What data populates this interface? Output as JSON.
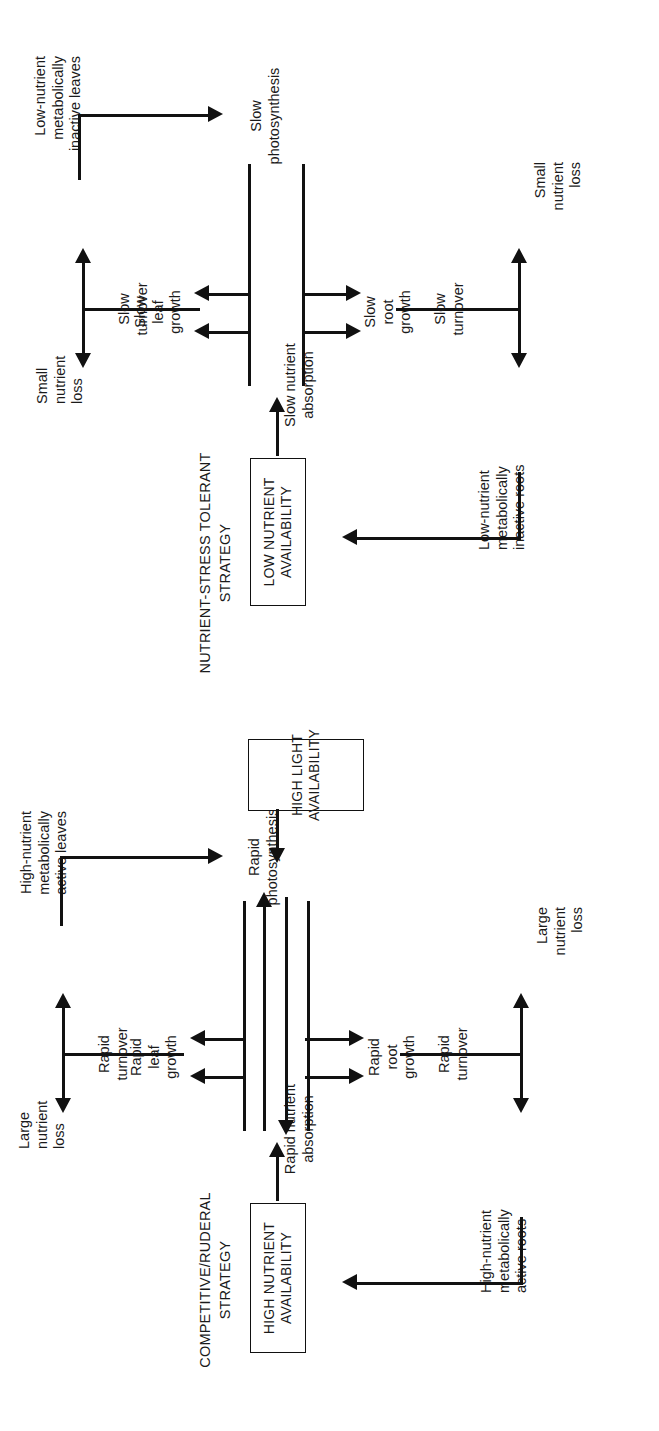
{
  "figure": {
    "ink_color": "#111111",
    "background_color": "#ffffff"
  },
  "panels": [
    {
      "id": "competitive-ruderal",
      "title": "COMPETITIVE/RUDERAL\nSTRATEGY",
      "env_boxes": [
        {
          "id": "high-nutrient-availability",
          "label": "HIGH NUTRIENT\nAVAILABILITY"
        },
        {
          "id": "high-light-availability",
          "label": "HIGH LIGHT\nAVAILABILITY"
        }
      ],
      "nodes": {
        "absorption": "Rapid nutrient\nabsorption",
        "photosynthesis": "Rapid\nphotosynthesis",
        "leaf_growth": "Rapid\nleaf\ngrowth",
        "root_growth": "Rapid\nroot\ngrowth",
        "leaves": "High-nutrient\nmetabolically\nactive leaves",
        "roots": "High-nutrient\nmetabolically\nactive roots",
        "leaf_loss": "Large\nnutrient\nloss",
        "root_loss": "Large\nnutrient\nloss"
      },
      "edge_labels": {
        "leaf_turnover": "Rapid\nturnover",
        "root_turnover": "Rapid\nturnover"
      }
    },
    {
      "id": "nutrient-stress-tolerant",
      "title": "NUTRIENT-STRESS TOLERANT\nSTRATEGY",
      "env_boxes": [
        {
          "id": "low-nutrient-availability",
          "label": "LOW NUTRIENT\nAVAILABILITY"
        }
      ],
      "nodes": {
        "absorption": "Slow nutrient\nabsorption",
        "photosynthesis": "Slow\nphotosynthesis",
        "leaf_growth": "Slow\nleaf\ngrowth",
        "root_growth": "Slow\nroot\ngrowth",
        "leaves": "Low-nutrient\nmetabolically\ninactive leaves",
        "roots": "Low-nutrient\nmetabolically\ninactive roots",
        "leaf_loss": "Small\nnutrient\nloss",
        "root_loss": "Small\nnutrient\nloss"
      },
      "edge_labels": {
        "leaf_turnover": "Slow\nturnover",
        "root_turnover": "Slow\nturnover"
      }
    }
  ]
}
